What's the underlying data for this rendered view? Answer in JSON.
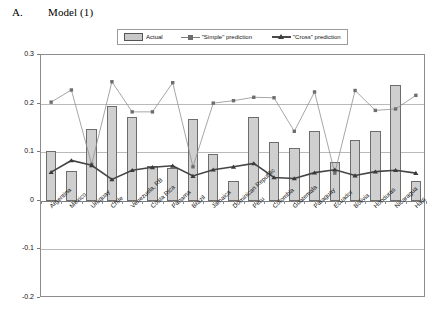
{
  "figure": {
    "panel_letter": "A.",
    "panel_title": "Model (1)"
  },
  "legend": {
    "position": "top",
    "items": [
      {
        "label": "Actual",
        "marker": "bar-swatch",
        "color": "#cfcfcf"
      },
      {
        "label": "\"Simple\" prediction",
        "marker": "square",
        "color": "#7d7d7d"
      },
      {
        "label": "\"Cross\" prediction",
        "marker": "triangle",
        "color": "#3d3d3d"
      }
    ]
  },
  "chart_data": {
    "type": "bar",
    "title": "Model (1)",
    "xlabel": "",
    "ylabel": "",
    "ylim": [
      -0.2,
      0.3
    ],
    "yticks": [
      "0.3",
      "0.2",
      "0.1",
      "0",
      "-0.1",
      "-0.2"
    ],
    "ytick_values": [
      0.3,
      0.2,
      0.1,
      0,
      -0.1,
      -0.2
    ],
    "grid": true,
    "legend_position": "top",
    "categories": [
      "Argentina",
      "Mexico",
      "Uruguay",
      "Chile",
      "Venezuela, RB",
      "Costa Rica",
      "Panama",
      "Brazil",
      "Jamaica",
      "Dominican Republic",
      "Peru",
      "Colombia",
      "Guatemala",
      "Paraguay",
      "Ecuador",
      "Bolivia",
      "Honduras",
      "Nicaragua",
      "Haiti"
    ],
    "series": [
      {
        "name": "Actual",
        "type": "bar",
        "values": [
          0.102,
          0.062,
          0.148,
          0.196,
          0.172,
          0.071,
          0.068,
          0.169,
          0.096,
          0.04,
          0.172,
          0.122,
          0.108,
          0.143,
          0.079,
          0.125,
          0.144,
          0.239,
          0.04
        ]
      },
      {
        "name": "\"Simple\" prediction",
        "type": "line",
        "values": [
          0.203,
          0.228,
          0.075,
          0.245,
          0.183,
          0.183,
          0.243,
          0.07,
          0.201,
          0.206,
          0.213,
          0.212,
          0.143,
          0.224,
          0.057,
          0.227,
          0.186,
          0.189,
          0.217
        ]
      },
      {
        "name": "\"Cross\" prediction",
        "type": "line",
        "values": [
          0.059,
          0.083,
          0.073,
          0.044,
          0.063,
          0.069,
          0.072,
          0.051,
          0.064,
          0.07,
          0.077,
          0.048,
          0.046,
          0.058,
          0.064,
          0.052,
          0.06,
          0.063,
          0.057
        ]
      }
    ]
  }
}
